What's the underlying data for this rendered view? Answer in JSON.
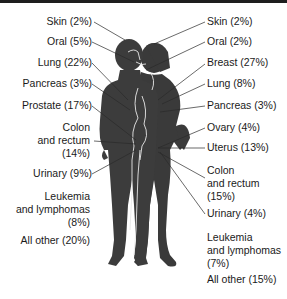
{
  "colors": {
    "silhouette": "#3a3a3a",
    "line": "#2a2a2a",
    "text": "#1a1a1a",
    "topbar": "#1e1e1e"
  },
  "male": {
    "label": "Male cancer sites",
    "items": [
      {
        "site": "Skin",
        "text": "Skin (2%)",
        "percent": 2
      },
      {
        "site": "Oral",
        "text": "Oral (5%)",
        "percent": 5
      },
      {
        "site": "Lung",
        "text": "Lung (22%)",
        "percent": 22
      },
      {
        "site": "Pancreas",
        "text": "Pancreas (3%)",
        "percent": 3
      },
      {
        "site": "Prostate",
        "text": "Prostate (17%)",
        "percent": 17
      },
      {
        "site": "Colon and rectum",
        "lines": [
          "Colon",
          "and rectum",
          "(14%)"
        ],
        "percent": 14
      },
      {
        "site": "Urinary",
        "text": "Urinary (9%)",
        "percent": 9
      },
      {
        "site": "Leukemia and lymphomas",
        "lines": [
          "Leukemia",
          "and lymphomas",
          "(8%)"
        ],
        "percent": 8
      },
      {
        "site": "All other",
        "text": "All other (20%)",
        "percent": 20
      }
    ]
  },
  "female": {
    "label": "Female cancer sites",
    "items": [
      {
        "site": "Skin",
        "text": "Skin (2%)",
        "percent": 2
      },
      {
        "site": "Oral",
        "text": "Oral (2%)",
        "percent": 2
      },
      {
        "site": "Breast",
        "text": "Breast (27%)",
        "percent": 27
      },
      {
        "site": "Lung",
        "text": "Lung (8%)",
        "percent": 8
      },
      {
        "site": "Pancreas",
        "text": "Pancreas (3%)",
        "percent": 3
      },
      {
        "site": "Ovary",
        "text": "Ovary (4%)",
        "percent": 4
      },
      {
        "site": "Uterus",
        "text": "Uterus (13%)",
        "percent": 13
      },
      {
        "site": "Colon and rectum",
        "lines": [
          "Colon",
          "and rectum",
          "(15%)"
        ],
        "percent": 15
      },
      {
        "site": "Urinary",
        "text": "Urinary (4%)",
        "percent": 4
      },
      {
        "site": "Leukemia and lymphomas",
        "lines": [
          "Leukemia",
          "and lymphomas",
          "(7%)"
        ],
        "percent": 7
      },
      {
        "site": "All other",
        "text": "All other (15%)",
        "percent": 15
      }
    ]
  }
}
